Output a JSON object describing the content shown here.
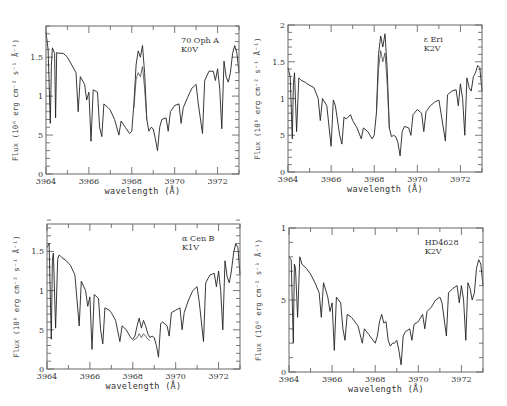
{
  "chart_data": [
    {
      "type": "line",
      "title": "",
      "annotation": [
        "70 Oph A",
        "K0V"
      ],
      "xlabel": "wavelength (Å)",
      "ylabel": "Flux (10⁶ erg cm⁻² s⁻¹ Å⁻¹)",
      "xlim": [
        3964,
        3973
      ],
      "ylim": [
        0,
        1.9
      ],
      "xticks": [
        3964,
        3966,
        3968,
        3970,
        3972
      ],
      "yticks": [
        0,
        0.5,
        1,
        1.5
      ],
      "ytick_labels": [
        "0",
        "5",
        "1",
        "1.5"
      ],
      "grid": false,
      "frame": {
        "left": 46,
        "top": 26,
        "right": 239,
        "bottom": 174
      },
      "series": [
        {
          "name": "observed spectrum",
          "x": [
            3964.0,
            3964.1,
            3964.2,
            3964.25,
            3964.3,
            3964.4,
            3964.45,
            3964.5,
            3964.6,
            3964.8,
            3965.0,
            3965.2,
            3965.4,
            3965.5,
            3965.6,
            3965.8,
            3965.9,
            3966.0,
            3966.1,
            3966.2,
            3966.4,
            3966.5,
            3966.6,
            3966.7,
            3966.9,
            3967.0,
            3967.2,
            3967.4,
            3967.5,
            3967.7,
            3967.9,
            3968.0,
            3968.1,
            3968.2,
            3968.3,
            3968.4,
            3968.5,
            3968.6,
            3968.7,
            3968.8,
            3968.9,
            3969.0,
            3969.1,
            3969.2,
            3969.3,
            3969.4,
            3969.6,
            3969.7,
            3969.8,
            3970.0,
            3970.2,
            3970.3,
            3970.4,
            3970.6,
            3970.8,
            3971.0,
            3971.1,
            3971.3,
            3971.4,
            3971.6,
            3971.8,
            3971.9,
            3972.0,
            3972.1,
            3972.2,
            3972.3,
            3972.4,
            3972.5,
            3972.6,
            3972.7,
            3972.8,
            3972.9,
            3973.0
          ],
          "y": [
            1.82,
            1.6,
            0.65,
            1.4,
            1.62,
            1.55,
            0.72,
            1.56,
            1.55,
            1.55,
            1.5,
            1.4,
            1.3,
            0.8,
            1.25,
            1.15,
            0.95,
            1.05,
            0.42,
            1.08,
            1.05,
            0.6,
            0.48,
            0.9,
            0.85,
            0.82,
            0.7,
            0.5,
            0.68,
            0.6,
            0.52,
            0.55,
            0.9,
            1.4,
            1.58,
            1.5,
            1.65,
            1.3,
            0.7,
            0.55,
            0.6,
            0.58,
            0.45,
            0.3,
            0.6,
            0.7,
            0.72,
            0.55,
            0.8,
            0.88,
            0.9,
            0.65,
            0.85,
            0.98,
            1.1,
            1.15,
            0.9,
            0.52,
            1.2,
            1.32,
            1.32,
            1.2,
            1.35,
            1.1,
            0.58,
            1.45,
            1.25,
            1.18,
            1.3,
            1.55,
            1.65,
            1.55,
            1.3
          ]
        },
        {
          "name": "model / second epoch (H emission lower)",
          "x": [
            3968.1,
            3968.2,
            3968.3,
            3968.4,
            3968.5,
            3968.6,
            3968.7
          ],
          "y": [
            0.85,
            1.22,
            1.3,
            1.25,
            1.38,
            1.1,
            0.7
          ]
        }
      ]
    },
    {
      "type": "line",
      "annotation": [
        "ε Eri",
        "K2V"
      ],
      "xlabel": "wavelength (Å)",
      "ylabel": "Flux (10⁶ erg cm⁻² s⁻¹ Å⁻¹)",
      "xlim": [
        3964,
        3973
      ],
      "ylim": [
        0,
        2
      ],
      "xticks": [
        3964,
        3966,
        3968,
        3970,
        3972
      ],
      "yticks": [
        0,
        0.5,
        1,
        1.5,
        2
      ],
      "ytick_labels": [
        "0",
        "5",
        "1",
        "1.5",
        "2"
      ],
      "grid": false,
      "frame": {
        "left": 288,
        "top": 25,
        "right": 482,
        "bottom": 172
      },
      "series": [
        {
          "name": "observed spectrum",
          "x": [
            3964.0,
            3964.1,
            3964.2,
            3964.25,
            3964.3,
            3964.4,
            3964.5,
            3964.6,
            3964.8,
            3965.0,
            3965.2,
            3965.4,
            3965.5,
            3965.6,
            3965.8,
            3966.0,
            3966.1,
            3966.2,
            3966.4,
            3966.5,
            3966.6,
            3966.7,
            3966.9,
            3967.0,
            3967.2,
            3967.4,
            3967.5,
            3967.7,
            3967.9,
            3968.0,
            3968.1,
            3968.2,
            3968.3,
            3968.4,
            3968.5,
            3968.6,
            3968.7,
            3968.8,
            3968.9,
            3969.0,
            3969.1,
            3969.2,
            3969.3,
            3969.4,
            3969.6,
            3969.7,
            3969.8,
            3970.0,
            3970.2,
            3970.3,
            3970.4,
            3970.6,
            3970.8,
            3971.0,
            3971.1,
            3971.3,
            3971.4,
            3971.6,
            3971.8,
            3971.9,
            3972.0,
            3972.1,
            3972.2,
            3972.3,
            3972.4,
            3972.5,
            3972.6,
            3972.7,
            3972.8,
            3972.9,
            3973.0
          ],
          "y": [
            1.42,
            1.3,
            0.45,
            1.2,
            1.35,
            0.55,
            1.28,
            1.25,
            1.22,
            1.18,
            1.15,
            1.0,
            0.7,
            1.0,
            0.9,
            0.35,
            0.98,
            0.9,
            0.5,
            0.38,
            0.75,
            0.72,
            0.78,
            0.7,
            0.6,
            0.45,
            0.6,
            0.55,
            0.45,
            0.5,
            0.8,
            1.6,
            1.85,
            1.7,
            1.88,
            1.4,
            0.6,
            0.48,
            0.5,
            0.48,
            0.4,
            0.22,
            0.55,
            0.62,
            0.6,
            0.5,
            0.78,
            0.85,
            0.8,
            0.55,
            0.82,
            0.9,
            0.95,
            0.98,
            0.8,
            0.42,
            1.05,
            1.1,
            1.12,
            0.9,
            1.2,
            1.0,
            0.5,
            1.28,
            1.15,
            1.1,
            1.3,
            1.35,
            1.45,
            1.42,
            1.1
          ]
        },
        {
          "name": "model / second epoch (H emission lower)",
          "x": [
            3968.1,
            3968.2,
            3968.3,
            3968.4,
            3968.5,
            3968.6,
            3968.7
          ],
          "y": [
            0.78,
            1.4,
            1.65,
            1.5,
            1.62,
            1.2,
            0.6
          ]
        }
      ]
    },
    {
      "type": "line",
      "annotation": [
        "α Cen B",
        "K1V"
      ],
      "xlabel": "wavelength (Å)",
      "ylabel": "Flux (10⁶ erg cm⁻² s⁻¹ Å⁻¹)",
      "xlim": [
        3964,
        3973
      ],
      "ylim": [
        0,
        1.85
      ],
      "xticks": [
        3964,
        3966,
        3968,
        3970,
        3972
      ],
      "yticks": [
        0,
        0.5,
        1,
        1.5
      ],
      "ytick_labels": [
        "0",
        "5",
        "1",
        "1.5"
      ],
      "grid": false,
      "frame": {
        "left": 47,
        "top": 224,
        "right": 240,
        "bottom": 369
      },
      "series": [
        {
          "name": "observed spectrum",
          "x": [
            3964.0,
            3964.1,
            3964.2,
            3964.25,
            3964.3,
            3964.4,
            3964.5,
            3964.55,
            3964.6,
            3964.7,
            3964.9,
            3965.1,
            3965.3,
            3965.5,
            3965.6,
            3965.8,
            3965.9,
            3966.0,
            3966.1,
            3966.2,
            3966.4,
            3966.5,
            3966.6,
            3966.7,
            3966.9,
            3967.0,
            3967.2,
            3967.4,
            3967.5,
            3967.7,
            3967.9,
            3968.0,
            3968.1,
            3968.2,
            3968.3,
            3968.4,
            3968.5,
            3968.6,
            3968.7,
            3968.8,
            3968.9,
            3969.0,
            3969.1,
            3969.2,
            3969.3,
            3969.4,
            3969.6,
            3969.7,
            3969.8,
            3970.0,
            3970.2,
            3970.3,
            3970.4,
            3970.6,
            3970.8,
            3971.0,
            3971.1,
            3971.3,
            3971.4,
            3971.6,
            3971.8,
            3971.9,
            3972.0,
            3972.1,
            3972.2,
            3972.3,
            3972.4,
            3972.5,
            3972.6,
            3972.7,
            3972.8,
            3972.9,
            3973.0
          ],
          "y": [
            1.55,
            1.6,
            0.38,
            1.4,
            1.48,
            0.52,
            1.4,
            1.45,
            1.45,
            1.42,
            1.38,
            1.32,
            1.2,
            0.55,
            1.12,
            1.0,
            0.8,
            0.92,
            0.25,
            0.95,
            0.9,
            0.5,
            0.32,
            0.78,
            0.75,
            0.72,
            0.62,
            0.35,
            0.55,
            0.5,
            0.4,
            0.38,
            0.42,
            0.55,
            0.65,
            0.52,
            0.62,
            0.55,
            0.45,
            0.4,
            0.42,
            0.4,
            0.3,
            0.15,
            0.58,
            0.6,
            0.55,
            0.42,
            0.72,
            0.75,
            0.78,
            0.5,
            0.72,
            0.88,
            1.0,
            1.05,
            0.85,
            0.35,
            1.1,
            1.2,
            1.22,
            1.05,
            1.25,
            1.0,
            0.5,
            1.38,
            1.18,
            1.1,
            1.25,
            1.48,
            1.6,
            1.55,
            1.2
          ]
        },
        {
          "name": "model / second epoch (H emission lower)",
          "x": [
            3968.0,
            3968.2,
            3968.3,
            3968.4,
            3968.5,
            3968.6,
            3968.7,
            3968.8
          ],
          "y": [
            0.36,
            0.4,
            0.45,
            0.4,
            0.45,
            0.42,
            0.38,
            0.36
          ]
        }
      ]
    },
    {
      "type": "line",
      "annotation": [
        "HD4628",
        "K2V"
      ],
      "xlabel": "wavelength (Å)",
      "ylabel": "Flux (10⁶ erg cm⁻² s⁻¹ Å⁻¹)",
      "xlim": [
        3964,
        3973
      ],
      "ylim": [
        0,
        1
      ],
      "xticks": [
        3964,
        3966,
        3968,
        3970,
        3972
      ],
      "yticks": [
        0,
        0.5,
        1
      ],
      "ytick_labels": [
        "0",
        "5",
        "1"
      ],
      "grid": false,
      "frame": {
        "left": 289,
        "top": 228,
        "right": 483,
        "bottom": 372
      },
      "series": [
        {
          "name": "observed spectrum",
          "x": [
            3964.0,
            3964.1,
            3964.2,
            3964.25,
            3964.3,
            3964.4,
            3964.5,
            3964.6,
            3964.8,
            3965.0,
            3965.2,
            3965.4,
            3965.5,
            3965.6,
            3965.8,
            3965.9,
            3966.0,
            3966.1,
            3966.2,
            3966.4,
            3966.5,
            3966.6,
            3966.7,
            3966.9,
            3967.0,
            3967.2,
            3967.4,
            3967.5,
            3967.7,
            3967.9,
            3968.0,
            3968.1,
            3968.2,
            3968.3,
            3968.4,
            3968.5,
            3968.6,
            3968.7,
            3968.8,
            3968.9,
            3969.0,
            3969.1,
            3969.2,
            3969.3,
            3969.4,
            3969.6,
            3969.7,
            3969.8,
            3970.0,
            3970.2,
            3970.3,
            3970.4,
            3970.6,
            3970.8,
            3971.0,
            3971.1,
            3971.3,
            3971.4,
            3971.6,
            3971.8,
            3971.9,
            3972.0,
            3972.1,
            3972.2,
            3972.3,
            3972.4,
            3972.5,
            3972.6,
            3972.7,
            3972.8,
            3972.9,
            3973.0
          ],
          "y": [
            0.8,
            0.78,
            0.2,
            0.75,
            0.72,
            0.38,
            0.8,
            0.75,
            0.72,
            0.68,
            0.62,
            0.55,
            0.38,
            0.62,
            0.52,
            0.42,
            0.48,
            0.15,
            0.52,
            0.48,
            0.3,
            0.22,
            0.4,
            0.38,
            0.36,
            0.32,
            0.2,
            0.3,
            0.26,
            0.22,
            0.2,
            0.25,
            0.35,
            0.4,
            0.34,
            0.35,
            0.22,
            0.18,
            0.2,
            0.2,
            0.22,
            0.15,
            0.05,
            0.25,
            0.28,
            0.3,
            0.22,
            0.33,
            0.35,
            0.4,
            0.3,
            0.42,
            0.45,
            0.5,
            0.52,
            0.48,
            0.25,
            0.55,
            0.58,
            0.6,
            0.48,
            0.6,
            0.5,
            0.22,
            0.62,
            0.58,
            0.5,
            0.55,
            0.72,
            0.78,
            0.75,
            0.6
          ]
        }
      ]
    }
  ],
  "panels": [
    {
      "star": "70 Oph A",
      "sptype": "K0V",
      "xlabel": "wavelength (Å)",
      "ylabel": "Flux (10⁶ erg cm⁻² s⁻¹ Å⁻¹)"
    },
    {
      "star": "ε Eri",
      "sptype": "K2V",
      "xlabel": "wavelength (Å)",
      "ylabel": "Flux (10⁶ erg cm⁻² s⁻¹ Å⁻¹)"
    },
    {
      "star": "α Cen B",
      "sptype": "K1V",
      "xlabel": "wavelength (Å)",
      "ylabel": "Flux (10⁶ erg cm⁻² s⁻¹ Å⁻¹)"
    },
    {
      "star": "HD4628",
      "sptype": "K2V",
      "xlabel": "wavelength (Å)",
      "ylabel": "Flux (10⁶ erg cm⁻² s⁻¹ Å⁻¹)"
    }
  ]
}
